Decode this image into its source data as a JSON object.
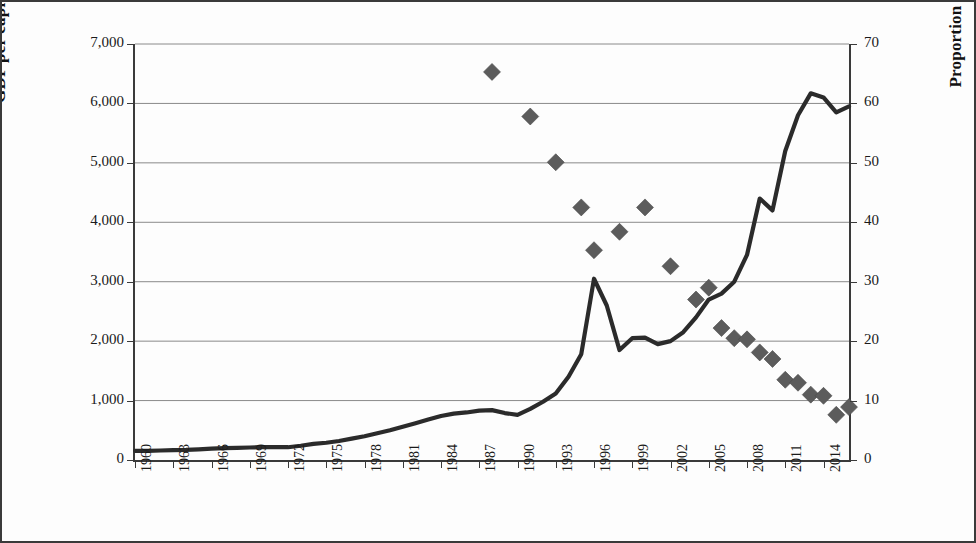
{
  "chart_data": {
    "type": "line",
    "title": "",
    "xlabel": "",
    "ylabel": "GDP per capita (US$)",
    "y2label": "Proportion of the poor (%)",
    "xlim": [
      1960,
      2016
    ],
    "ylim": [
      0,
      7000
    ],
    "y2lim": [
      0,
      70
    ],
    "grid": true,
    "legend": "none",
    "x_tick_labels": [
      "1960",
      "1963",
      "1966",
      "1969",
      "1972",
      "1975",
      "1978",
      "1981",
      "1984",
      "1987",
      "1990",
      "1993",
      "1996",
      "1999",
      "2002",
      "2005",
      "2008",
      "2011",
      "2014"
    ],
    "x_tick_step_years": 3,
    "y_tick_labels": [
      "0",
      "1,000",
      "2,000",
      "3,000",
      "4,000",
      "5,000",
      "6,000",
      "7,000"
    ],
    "y_tick_values": [
      0,
      1000,
      2000,
      3000,
      4000,
      5000,
      6000,
      7000
    ],
    "y2_tick_labels": [
      "0",
      "10",
      "20",
      "30",
      "40",
      "50",
      "60",
      "70"
    ],
    "y2_tick_values": [
      0,
      10,
      20,
      30,
      40,
      50,
      60,
      70
    ],
    "series": [
      {
        "name": "GDP per capita (US$)",
        "type": "line",
        "axis": "left",
        "color": "#2b2b2b",
        "x": [
          1960,
          1961,
          1962,
          1963,
          1964,
          1965,
          1966,
          1967,
          1968,
          1969,
          1970,
          1971,
          1972,
          1973,
          1974,
          1975,
          1976,
          1977,
          1978,
          1979,
          1980,
          1981,
          1982,
          1983,
          1984,
          1985,
          1986,
          1987,
          1988,
          1989,
          1990,
          1991,
          1992,
          1993,
          1994,
          1995,
          1996,
          1997,
          1998,
          1999,
          2000,
          2001,
          2002,
          2003,
          2004,
          2005,
          2006,
          2007,
          2008,
          2009,
          2010,
          2011,
          2012,
          2013,
          2014,
          2015,
          2016
        ],
        "y": [
          155,
          155,
          160,
          165,
          170,
          180,
          190,
          200,
          205,
          210,
          215,
          215,
          215,
          240,
          270,
          290,
          320,
          360,
          400,
          450,
          500,
          560,
          620,
          680,
          740,
          780,
          800,
          830,
          840,
          790,
          760,
          860,
          980,
          1120,
          1400,
          1780,
          3050,
          2600,
          1850,
          2050,
          2060,
          1950,
          2000,
          2150,
          2400,
          2700,
          2800,
          3000,
          3450,
          4400,
          4200,
          5200,
          5800,
          6170,
          6100,
          5850,
          5950
        ]
      },
      {
        "name": "Proportion of the poor (%)",
        "type": "scatter",
        "axis": "right",
        "marker": "diamond",
        "color": "#5c5c5c",
        "x": [
          1988,
          1991,
          1993,
          1995,
          1996,
          1998,
          2000,
          2002,
          2004,
          2005,
          2006,
          2007,
          2008,
          2009,
          2010,
          2011,
          2012,
          2013,
          2014,
          2015,
          2016
        ],
        "y": [
          65.3,
          57.8,
          50.1,
          42.5,
          35.3,
          38.4,
          42.5,
          32.6,
          27.0,
          29.0,
          22.2,
          20.5,
          20.3,
          18.1,
          17.0,
          13.5,
          13.0,
          11.0,
          10.8,
          7.6,
          8.9
        ]
      }
    ]
  },
  "axes": {
    "left_title": "GDP per capita (US$)",
    "right_title": "Proportion of the poor (%)"
  }
}
